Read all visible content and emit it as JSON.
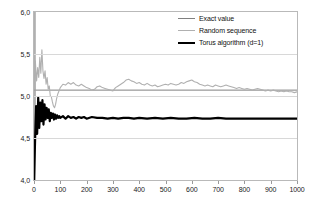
{
  "chart_data": {
    "type": "line",
    "title": "",
    "xlabel": "",
    "ylabel": "",
    "xlim": [
      0,
      1000
    ],
    "ylim": [
      4.0,
      6.0
    ],
    "grid": true,
    "legend_position": "inside-top-right",
    "x_ticks": [
      0,
      100,
      200,
      300,
      400,
      500,
      600,
      700,
      800,
      900,
      1000
    ],
    "x_tick_labels": [
      "0",
      "100",
      "200",
      "300",
      "400",
      "500",
      "600",
      "700",
      "800",
      "900",
      "1000"
    ],
    "y_ticks": [
      4.0,
      4.5,
      5.0,
      5.5,
      6.0
    ],
    "y_tick_labels": [
      "4,0",
      "4,5",
      "5,0",
      "5,5",
      "6,0"
    ],
    "decimal_separator": ",",
    "series": [
      {
        "name": "Exact value",
        "color": "#808080",
        "width": 1,
        "style": "horizontal-constant",
        "value": 5.07,
        "x": [
          0,
          1000
        ],
        "values": [
          5.07,
          5.07
        ]
      },
      {
        "name": "Random sequence",
        "color": "#b0b0b0",
        "width": 1.1,
        "style": "noisy-convergent",
        "x": [
          0,
          5,
          10,
          14,
          18,
          22,
          26,
          30,
          34,
          38,
          42,
          46,
          50,
          54,
          58,
          62,
          66,
          70,
          74,
          78,
          82,
          86,
          90,
          95,
          100,
          110,
          120,
          130,
          140,
          150,
          160,
          170,
          180,
          190,
          200,
          210,
          220,
          230,
          240,
          250,
          260,
          270,
          280,
          290,
          300,
          310,
          320,
          330,
          340,
          350,
          360,
          370,
          380,
          390,
          400,
          410,
          420,
          430,
          440,
          450,
          460,
          470,
          480,
          490,
          500,
          510,
          520,
          530,
          540,
          550,
          560,
          570,
          580,
          590,
          600,
          610,
          620,
          630,
          640,
          650,
          660,
          670,
          680,
          690,
          700,
          710,
          720,
          730,
          740,
          750,
          760,
          770,
          780,
          790,
          800,
          810,
          820,
          830,
          840,
          850,
          860,
          870,
          880,
          890,
          900,
          910,
          920,
          930,
          940,
          950,
          960,
          970,
          980,
          990,
          1000
        ],
        "values": [
          4.0,
          5.42,
          5.18,
          5.34,
          5.22,
          5.46,
          5.27,
          5.55,
          5.3,
          5.21,
          5.3,
          5.14,
          5.22,
          5.08,
          5.12,
          5.0,
          4.99,
          4.93,
          4.88,
          4.86,
          4.9,
          4.97,
          5.02,
          5.06,
          5.1,
          5.14,
          5.13,
          5.16,
          5.14,
          5.16,
          5.13,
          5.12,
          5.14,
          5.12,
          5.1,
          5.09,
          5.07,
          5.08,
          5.11,
          5.12,
          5.1,
          5.09,
          5.08,
          5.07,
          5.06,
          5.1,
          5.12,
          5.14,
          5.16,
          5.19,
          5.2,
          5.18,
          5.17,
          5.15,
          5.16,
          5.14,
          5.13,
          5.15,
          5.13,
          5.12,
          5.13,
          5.11,
          5.12,
          5.13,
          5.14,
          5.13,
          5.15,
          5.14,
          5.13,
          5.14,
          5.16,
          5.15,
          5.17,
          5.18,
          5.19,
          5.17,
          5.16,
          5.14,
          5.13,
          5.12,
          5.13,
          5.12,
          5.11,
          5.13,
          5.12,
          5.11,
          5.12,
          5.13,
          5.12,
          5.11,
          5.1,
          5.09,
          5.1,
          5.09,
          5.08,
          5.09,
          5.08,
          5.07,
          5.08,
          5.09,
          5.08,
          5.07,
          5.06,
          5.07,
          5.06,
          5.07,
          5.06,
          5.05,
          5.06,
          5.05,
          5.06,
          5.05,
          5.05,
          5.04,
          5.05
        ]
      },
      {
        "name": "Torus algorithm (d=1)",
        "color": "#000000",
        "width": 2.2,
        "style": "noisy-convergent",
        "x": [
          0,
          4,
          8,
          12,
          16,
          20,
          24,
          28,
          32,
          36,
          40,
          44,
          48,
          52,
          56,
          60,
          64,
          68,
          72,
          76,
          80,
          84,
          88,
          92,
          96,
          100,
          110,
          120,
          130,
          140,
          150,
          160,
          170,
          180,
          190,
          200,
          220,
          240,
          260,
          280,
          300,
          320,
          340,
          360,
          380,
          400,
          430,
          460,
          490,
          520,
          550,
          580,
          610,
          640,
          670,
          700,
          730,
          760,
          790,
          820,
          850,
          880,
          910,
          940,
          970,
          1000
        ],
        "values": [
          4.0,
          4.46,
          4.88,
          4.55,
          4.98,
          4.62,
          4.92,
          4.7,
          4.95,
          4.66,
          4.9,
          4.72,
          4.86,
          4.74,
          4.84,
          4.7,
          4.8,
          4.74,
          4.79,
          4.72,
          4.78,
          4.73,
          4.77,
          4.74,
          4.76,
          4.74,
          4.76,
          4.73,
          4.76,
          4.74,
          4.75,
          4.73,
          4.75,
          4.74,
          4.75,
          4.73,
          4.75,
          4.74,
          4.74,
          4.73,
          4.74,
          4.73,
          4.74,
          4.74,
          4.73,
          4.74,
          4.73,
          4.74,
          4.73,
          4.74,
          4.73,
          4.73,
          4.74,
          4.73,
          4.73,
          4.74,
          4.73,
          4.73,
          4.73,
          4.73,
          4.73,
          4.73,
          4.73,
          4.73,
          4.73,
          4.73
        ]
      }
    ],
    "initial_transient": {
      "name": "initial-vertical-transient",
      "x": 2,
      "color": "#b0b0b0",
      "from": 4.0,
      "to": 6.0
    },
    "annotations": []
  },
  "legend": {
    "items": [
      {
        "label": "Exact value",
        "color": "#808080",
        "thickness": 1
      },
      {
        "label": "Random sequence",
        "color": "#b0b0b0",
        "thickness": 1
      },
      {
        "label": "Torus algorithm (d=1)",
        "color": "#000000",
        "thickness": 2.4
      }
    ]
  }
}
